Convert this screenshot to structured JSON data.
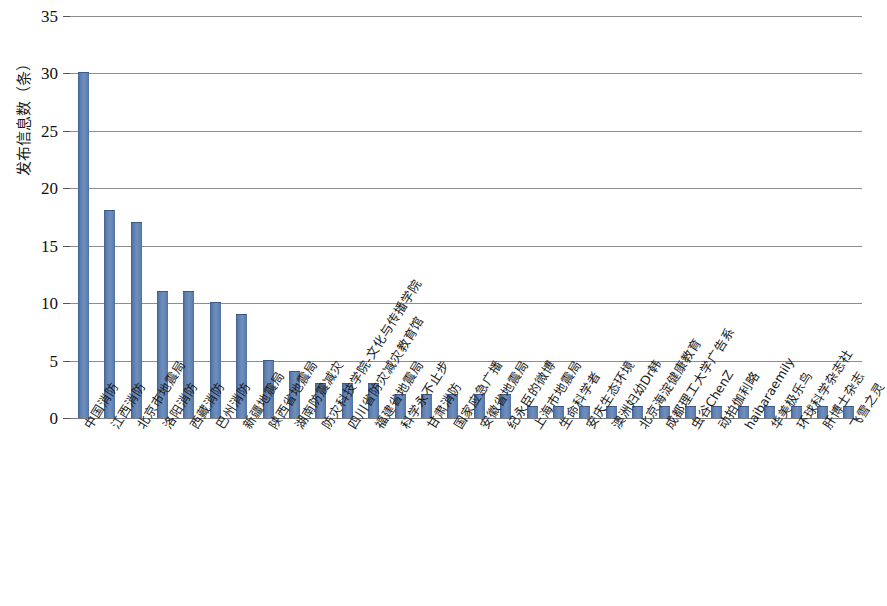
{
  "chart_data": {
    "type": "bar",
    "title": "",
    "xlabel": "",
    "ylabel": "发布信息数（条）",
    "ylim": [
      0,
      35
    ],
    "yticks": [
      0,
      5,
      10,
      15,
      20,
      25,
      30,
      35
    ],
    "ytick_labels": [
      "0",
      "5",
      "10",
      "15",
      "20",
      "25",
      "30",
      "35"
    ],
    "grid": true,
    "legend": false,
    "bar_color": "#5c7fb0",
    "categories": [
      "中国消防",
      "江西消防",
      "北京市地震局",
      "洛阳消防",
      "西藏消防",
      "巴州消防",
      "新疆地震局",
      "陕西省地震局",
      "湖南防震减灾",
      "防灾科技学院-文化与传播学院",
      "四川省防灾减灾教育馆",
      "福建省地震局",
      "科学永不止步",
      "甘肃消防",
      "国家应急广播",
      "安徽省地震局",
      "纪永臣的微博",
      "上海市地震局",
      "生命科学者",
      "安庆生态环境",
      "澳洲妇幼Dr韩",
      "北京海淀健康教育",
      "成都理工大学广告系",
      "虫谷ChenZ",
      "动拍伽利略",
      "haibaraemily",
      "华美极乐鸟",
      "环球科学杂志社",
      "肝博士杂志",
      "飞雪之灵"
    ],
    "values": [
      30,
      18,
      17,
      11,
      11,
      10,
      9,
      5,
      4,
      3,
      3,
      3,
      2,
      2,
      2,
      2,
      2,
      1,
      1,
      1,
      1,
      1,
      1,
      1,
      1,
      1,
      1,
      1,
      1,
      1
    ]
  }
}
